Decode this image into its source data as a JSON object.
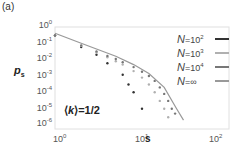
{
  "panel_label": "(a)",
  "chart_data": {
    "type": "scatter",
    "title": "",
    "xlabel": "s",
    "ylabel": "p_s",
    "xscale": "log",
    "yscale": "log",
    "xlim": [
      1,
      100
    ],
    "ylim": [
      1e-06,
      1
    ],
    "x_ticks": [
      "10^0",
      "10^1",
      "10^2"
    ],
    "y_ticks": [
      "10^0",
      "10^-1",
      "10^-2",
      "10^-3",
      "10^-4",
      "10^-5",
      "10^-6"
    ],
    "grid": false,
    "legend_position": "upper right",
    "annotation": "⟨k⟩=1/2",
    "series": [
      {
        "name": "N=10^2",
        "color": "#333333",
        "style": "points",
        "x": [
          1,
          2,
          3,
          4,
          6,
          7,
          8,
          10
        ],
        "y": [
          0.3,
          0.06,
          0.02,
          0.006,
          0.0012,
          0.0003,
          0.0001,
          1e-05
        ]
      },
      {
        "name": "N=10^3",
        "color": "#b0b0b0",
        "style": "points",
        "x": [
          1,
          2,
          3,
          4,
          5,
          6,
          8,
          10,
          12,
          14,
          16,
          18,
          20
        ],
        "y": [
          0.3,
          0.07,
          0.028,
          0.014,
          0.008,
          0.005,
          0.002,
          0.0008,
          0.0003,
          0.0001,
          3e-05,
          1e-05,
          3e-06
        ]
      },
      {
        "name": "N=10^4",
        "color": "#777777",
        "style": "points",
        "x": [
          1,
          2,
          3,
          4,
          5,
          6,
          8,
          10,
          12,
          14,
          16,
          18,
          20,
          22,
          24
        ],
        "y": [
          0.3,
          0.075,
          0.032,
          0.017,
          0.011,
          0.007,
          0.0035,
          0.0018,
          0.001,
          0.0005,
          0.0002,
          8e-05,
          3e-05,
          1e-05,
          5e-06
        ]
      },
      {
        "name": "N=∞",
        "color": "#999999",
        "style": "line",
        "x": [
          1,
          2,
          3,
          5,
          8,
          12,
          18,
          25,
          30
        ],
        "y": [
          0.42,
          0.1,
          0.045,
          0.016,
          0.005,
          0.0014,
          0.0002,
          1e-05,
          2e-06
        ]
      }
    ]
  },
  "axes": {
    "ylabel_main": "p",
    "ylabel_sub": "s",
    "xlabel": "s",
    "yticks": [
      {
        "base": "10",
        "exp": "0"
      },
      {
        "base": "10",
        "exp": "-1"
      },
      {
        "base": "10",
        "exp": "-2"
      },
      {
        "base": "10",
        "exp": "-3"
      },
      {
        "base": "10",
        "exp": "-4"
      },
      {
        "base": "10",
        "exp": "-5"
      },
      {
        "base": "10",
        "exp": "-6"
      }
    ],
    "xticks": [
      {
        "base": "10",
        "exp": "0"
      },
      {
        "base": "10",
        "exp": "1"
      },
      {
        "base": "10",
        "exp": "2"
      }
    ]
  },
  "annotation": {
    "pre": "⟨",
    "var": "k",
    "post": "⟩=1/2"
  },
  "legend": [
    {
      "n": "N",
      "eq": "=10",
      "exp": "2",
      "color": "#333333"
    },
    {
      "n": "N",
      "eq": "=10",
      "exp": "3",
      "color": "#b0b0b0"
    },
    {
      "n": "N",
      "eq": "=10",
      "exp": "4",
      "color": "#777777"
    },
    {
      "n": "N",
      "eq": "=∞",
      "exp": "",
      "color": "#999999"
    }
  ]
}
